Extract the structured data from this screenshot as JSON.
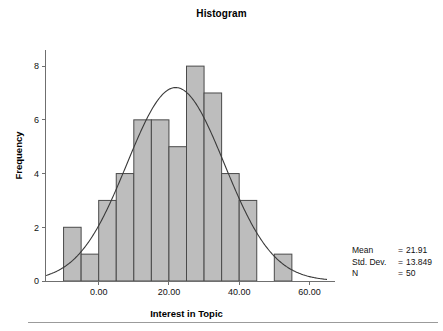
{
  "chart": {
    "title": "Histogram"
  },
  "stats": {
    "rows": [
      {
        "label": "Mean",
        "eq": "=",
        "value": "21.91"
      },
      {
        "label": "Std. Dev.",
        "eq": "=",
        "value": "13.849"
      },
      {
        "label": "N",
        "eq": "=",
        "value": "50"
      }
    ]
  },
  "chart_data": {
    "type": "bar",
    "title": "Histogram",
    "subtitle": "",
    "xlabel": "Interest in Topic",
    "ylabel": "Frequency",
    "xlim": [
      -15,
      65
    ],
    "ylim": [
      0,
      8.6
    ],
    "grid": false,
    "legend": null,
    "x_ticks": [
      0,
      20,
      40,
      60
    ],
    "x_tick_labels": [
      "0.00",
      "20.00",
      "40.00",
      "60.00"
    ],
    "y_ticks": [
      0,
      2,
      4,
      6,
      8
    ],
    "y_tick_labels": [
      "0",
      "2",
      "4",
      "6",
      "8"
    ],
    "bin_width": 5,
    "bin_edges": [
      -10,
      -5,
      0,
      5,
      10,
      15,
      20,
      25,
      30,
      35,
      40,
      45,
      50,
      55
    ],
    "bin_centers": [
      -7.5,
      -2.5,
      2.5,
      7.5,
      12.5,
      17.5,
      22.5,
      27.5,
      32.5,
      37.5,
      42.5,
      47.5,
      52.5
    ],
    "categories": [
      "-10 to -5",
      "-5 to 0",
      "0 to 5",
      "5 to 10",
      "10 to 15",
      "15 to 20",
      "20 to 25",
      "25 to 30",
      "30 to 35",
      "35 to 40",
      "40 to 45",
      "45 to 50",
      "50 to 55"
    ],
    "values": [
      2,
      1,
      3,
      4,
      6,
      6,
      5,
      8,
      7,
      4,
      3,
      0,
      1
    ],
    "bar_color": "#bdbdbd",
    "bar_edge_color": "#4a4a4a",
    "overlay": {
      "type": "normal_curve",
      "mean": 21.91,
      "std_dev": 13.849,
      "n": 50,
      "bin_width": 5,
      "peak_value": 7.2,
      "color": "#3a3a3a"
    },
    "annotations": [
      "Mean = 21.91",
      "Std. Dev. = 13.849",
      "N = 50"
    ]
  }
}
